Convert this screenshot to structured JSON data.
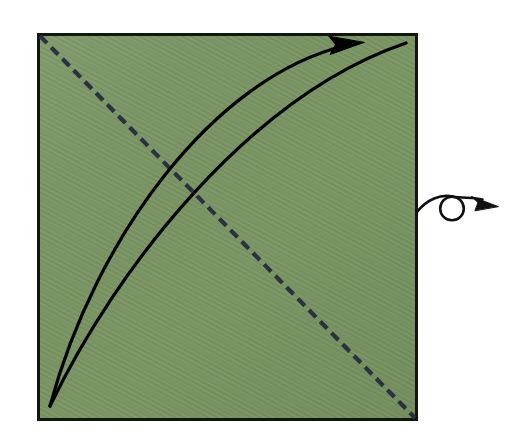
{
  "figure": {
    "kind": "origami-fold-diagram",
    "title": "Origami step: valley-fold bottom-left corner up along diagonal, then turn over",
    "canvas": {
      "width": 530,
      "height": 444,
      "background": "#ffffff"
    }
  },
  "colors": {
    "paper_green": "#7b9564",
    "paper_green_dark": "#6f8a59",
    "paper_green_light": "#86a06e",
    "paper_border": "#11160f",
    "crease_dashed": "#2b3142",
    "fold_arrow": "#000000",
    "turnover_symbol": "#111111"
  },
  "paper": {
    "name": "green-square-sheet",
    "label": "Green square of paper",
    "x": 37,
    "y": 33,
    "width": 381,
    "height": 388,
    "border_width": 3,
    "fill": "#7b9564"
  },
  "crease": {
    "name": "diagonal-crease",
    "label": "Existing diagonal crease (valley fold line)",
    "style": "dashed",
    "color": "#2b3142",
    "stroke_width": 4,
    "dash_length": 9,
    "gap_length": 6,
    "from": {
      "x": 39,
      "y": 35
    },
    "to": {
      "x": 416,
      "y": 419
    }
  },
  "fold_arrows": [
    {
      "name": "fold-arrow-outer",
      "label": "Outer fold motion arc with arrowhead",
      "has_arrowhead": true,
      "stroke_width": 3.4,
      "start": {
        "x": 50,
        "y": 406
      },
      "control1": {
        "x": 96,
        "y": 236
      },
      "control2": {
        "x": 214,
        "y": 78
      },
      "end": {
        "x": 362,
        "y": 43
      },
      "arrowhead": {
        "tip_x": 364,
        "tip_y": 43,
        "length": 26,
        "width": 14
      }
    },
    {
      "name": "fold-arrow-inner",
      "label": "Inner companion arc reaching the top-right corner",
      "has_arrowhead": false,
      "stroke_width": 3.4,
      "start": {
        "x": 50,
        "y": 406
      },
      "control1": {
        "x": 116,
        "y": 268
      },
      "control2": {
        "x": 250,
        "y": 96
      },
      "end": {
        "x": 406,
        "y": 43
      }
    }
  ],
  "turnover_symbol": {
    "name": "turn-over-symbol",
    "label": "Turn the model over",
    "circle": {
      "cx": 452,
      "cy": 208,
      "r": 12,
      "stroke_width": 2.6
    },
    "tail": {
      "start_x": 417,
      "start_y": 212,
      "end_x": 452,
      "end_y": 196
    },
    "head_curve": {
      "start_x": 452,
      "start_y": 196,
      "end_x": 489,
      "end_y": 199
    },
    "arrowhead": {
      "tip_x": 498,
      "tip_y": 206,
      "length": 22,
      "width": 12,
      "angle_deg": 28
    }
  },
  "labels": {
    "paper_alt": "Green square sheet with dashed diagonal crease",
    "arrow_alt": "Curved fold arrow from bottom-left corner to top-right corner",
    "turnover_alt": "Turn over symbol: looped arrow"
  }
}
